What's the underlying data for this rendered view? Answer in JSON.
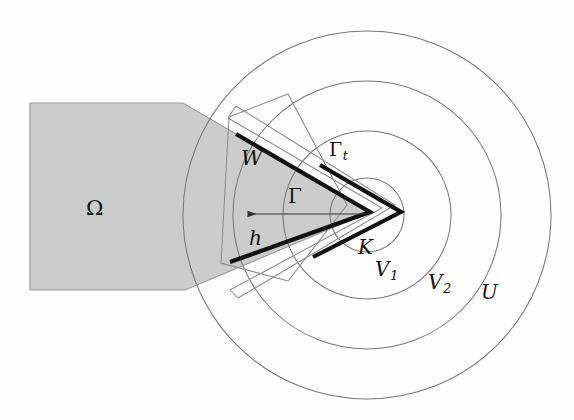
{
  "figure": {
    "type": "mathematical-diagram",
    "canvas": {
      "width": 574,
      "height": 420
    },
    "background_color": "#fefefe",
    "shaded_color": "#cccccc",
    "line_color": "#555555",
    "bold_line_color": "#111111"
  },
  "labels": {
    "omega": "Ω",
    "w": "W",
    "gamma": "Γ",
    "gamma_t_base": "Γ",
    "gamma_t_sub": "t",
    "h": "h",
    "k": "K",
    "v1_base": "V",
    "v1_sub": "1",
    "v2_base": "V",
    "v2_sub": "2",
    "u": "U"
  },
  "geometry": {
    "circle_center": {
      "x": 367,
      "y": 215
    },
    "circles": [
      {
        "name": "K",
        "radius": 37,
        "label": "K"
      },
      {
        "name": "V1",
        "radius": 84,
        "label": "V1"
      },
      {
        "name": "V2",
        "radius": 134,
        "label": "V2"
      },
      {
        "name": "U",
        "radius": 184,
        "label": "U"
      }
    ],
    "omega_polygon": "30,103 183,103 370,212 185,290 30,290",
    "gamma_apex": {
      "x": 370,
      "y": 212
    },
    "gamma_upper_end": {
      "x": 236,
      "y": 134
    },
    "gamma_lower_end": {
      "x": 230,
      "y": 262
    },
    "gamma_t_apex": {
      "x": 401,
      "y": 212
    },
    "gamma_t_upper_end": {
      "x": 320,
      "y": 165
    },
    "gamma_t_lower_end": {
      "x": 313,
      "y": 257
    },
    "arrow": {
      "tail_x": 366,
      "tail_y": 214,
      "head_x": 245,
      "head_y": 214,
      "direction": "left"
    },
    "w_rect": "229,117 288,94 347,205 288,281 221,263"
  }
}
